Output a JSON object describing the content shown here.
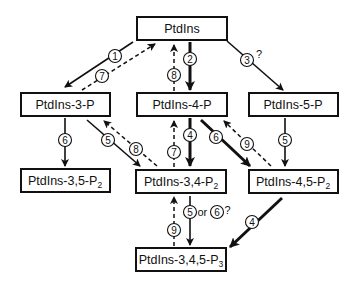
{
  "nodes": {
    "ptdins": {
      "label": "PtdIns",
      "sub": ""
    },
    "p3": {
      "label": "PtdIns-3-P",
      "sub": ""
    },
    "p4": {
      "label": "PtdIns-4-P",
      "sub": ""
    },
    "p5": {
      "label": "PtdIns-5-P",
      "sub": ""
    },
    "p35": {
      "label": "PtdIns-3,5-P",
      "sub": "2"
    },
    "p34": {
      "label": "PtdIns-3,4-P",
      "sub": "2"
    },
    "p45": {
      "label": "PtdIns-4,5-P",
      "sub": "2"
    },
    "p345": {
      "label": "PtdIns-3,4,5-P",
      "sub": "3"
    }
  },
  "edges": [
    {
      "id": "e1",
      "from": "ptdins",
      "to": "p3",
      "label": "1",
      "style": "solid",
      "note": ""
    },
    {
      "id": "e7a",
      "from": "p3",
      "to": "ptdins",
      "label": "7",
      "style": "dashed",
      "note": ""
    },
    {
      "id": "e2",
      "from": "ptdins",
      "to": "p4",
      "label": "2",
      "style": "thick",
      "note": ""
    },
    {
      "id": "e8a",
      "from": "p4",
      "to": "ptdins",
      "label": "8",
      "style": "dashed",
      "note": ""
    },
    {
      "id": "e3",
      "from": "ptdins",
      "to": "p5",
      "label": "3",
      "style": "solid",
      "note": "?"
    },
    {
      "id": "e6a",
      "from": "p3",
      "to": "p35",
      "label": "6",
      "style": "solid",
      "note": ""
    },
    {
      "id": "e5a",
      "from": "p3",
      "to": "p34",
      "label": "5",
      "style": "solid",
      "note": ""
    },
    {
      "id": "e8b",
      "from": "p34",
      "to": "p3",
      "label": "8",
      "style": "dashed",
      "note": ""
    },
    {
      "id": "e4a",
      "from": "p4",
      "to": "p34",
      "label": "4",
      "style": "thick",
      "note": ""
    },
    {
      "id": "e7b",
      "from": "p34",
      "to": "p4",
      "label": "7",
      "style": "dashed",
      "note": ""
    },
    {
      "id": "e6b",
      "from": "p4",
      "to": "p45",
      "label": "6",
      "style": "thick",
      "note": ""
    },
    {
      "id": "e9a",
      "from": "p45",
      "to": "p4",
      "label": "9",
      "style": "dashed",
      "note": ""
    },
    {
      "id": "e5b",
      "from": "p5",
      "to": "p45",
      "label": "5",
      "style": "solid",
      "note": ""
    },
    {
      "id": "e56",
      "from": "p34",
      "to": "p345",
      "label": "5",
      "style": "solid",
      "note": "or",
      "label2": "6",
      "note2": "?"
    },
    {
      "id": "e9b",
      "from": "p345",
      "to": "p34",
      "label": "9",
      "style": "dashed",
      "note": ""
    },
    {
      "id": "e4b",
      "from": "p45",
      "to": "p345",
      "label": "4",
      "style": "thick",
      "note": ""
    }
  ]
}
